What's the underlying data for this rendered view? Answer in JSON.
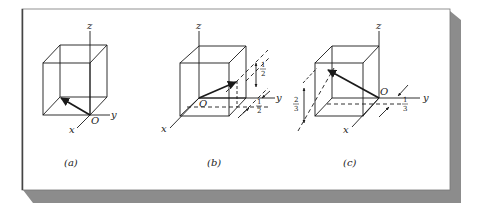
{
  "figure": {
    "frame_color": "#ffffff",
    "shadow_color": "#8c8c8c",
    "line_color": "#1a1a1a",
    "panels": [
      {
        "id": "a",
        "caption": "(a)",
        "axes": {
          "x": "x",
          "y": "y",
          "z": "z"
        },
        "origin_label": "O",
        "dimensions": []
      },
      {
        "id": "b",
        "caption": "(b)",
        "axes": {
          "x": "x",
          "y": "y",
          "z": "z"
        },
        "origin_label": "O",
        "dimensions": [
          {
            "label_num": "1",
            "label_den": "2",
            "orientation": "vertical"
          },
          {
            "label_num": "1",
            "label_den": "2",
            "orientation": "horizontal"
          }
        ]
      },
      {
        "id": "c",
        "caption": "(c)",
        "axes": {
          "x": "x",
          "y": "y",
          "z": "z"
        },
        "origin_label": "O",
        "dimensions": [
          {
            "label_num": "2",
            "label_den": "3",
            "orientation": "vertical"
          },
          {
            "label_num": "1",
            "label_den": "3",
            "orientation": "horizontal"
          }
        ]
      }
    ]
  }
}
